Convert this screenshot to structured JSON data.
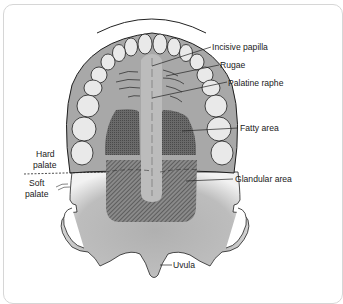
{
  "diagram": {
    "labels": {
      "incisive_papilla": "Incisive papilla",
      "rugae": "Rugae",
      "palatine_raphe": "Palatine raphe",
      "fatty_area": "Fatty area",
      "hard_palate_1": "Hard",
      "hard_palate_2": "palate",
      "soft_palate_1": "Soft",
      "soft_palate_2": "palate",
      "glandular_area": "Glandular area",
      "uvula": "Uvula"
    },
    "colors": {
      "gum": "#a9a9a9",
      "tooth": "#e8e8e8",
      "fatty": "#5e5e5e",
      "glandular": "#6b6b6b",
      "raphe": "#bfbfbf",
      "soft_palate": "#b5b5b5",
      "outline": "#1f1f1f",
      "frame": "#d6d6d6"
    }
  }
}
